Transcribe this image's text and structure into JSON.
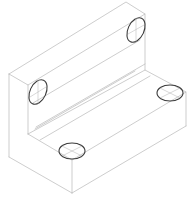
{
  "diagram": {
    "type": "isometric-drawing",
    "colors": {
      "background": "#ffffff",
      "edge": "#b8b8b8",
      "hole": "#3a3a3a",
      "centerline": "#b0b0b0"
    },
    "holes": [
      {
        "name": "upper-right-hole",
        "cx": 136,
        "cy": 30,
        "rx": 9,
        "ry": 13,
        "rot": 25
      },
      {
        "name": "upper-left-hole",
        "cx": 38,
        "cy": 92,
        "rx": 9,
        "ry": 13,
        "rot": 25
      },
      {
        "name": "base-right-hole",
        "cx": 170,
        "cy": 93,
        "rx": 13,
        "ry": 8,
        "rot": 0
      },
      {
        "name": "base-left-hole",
        "cx": 72,
        "cy": 151,
        "rx": 13,
        "ry": 8,
        "rot": 0
      }
    ]
  }
}
